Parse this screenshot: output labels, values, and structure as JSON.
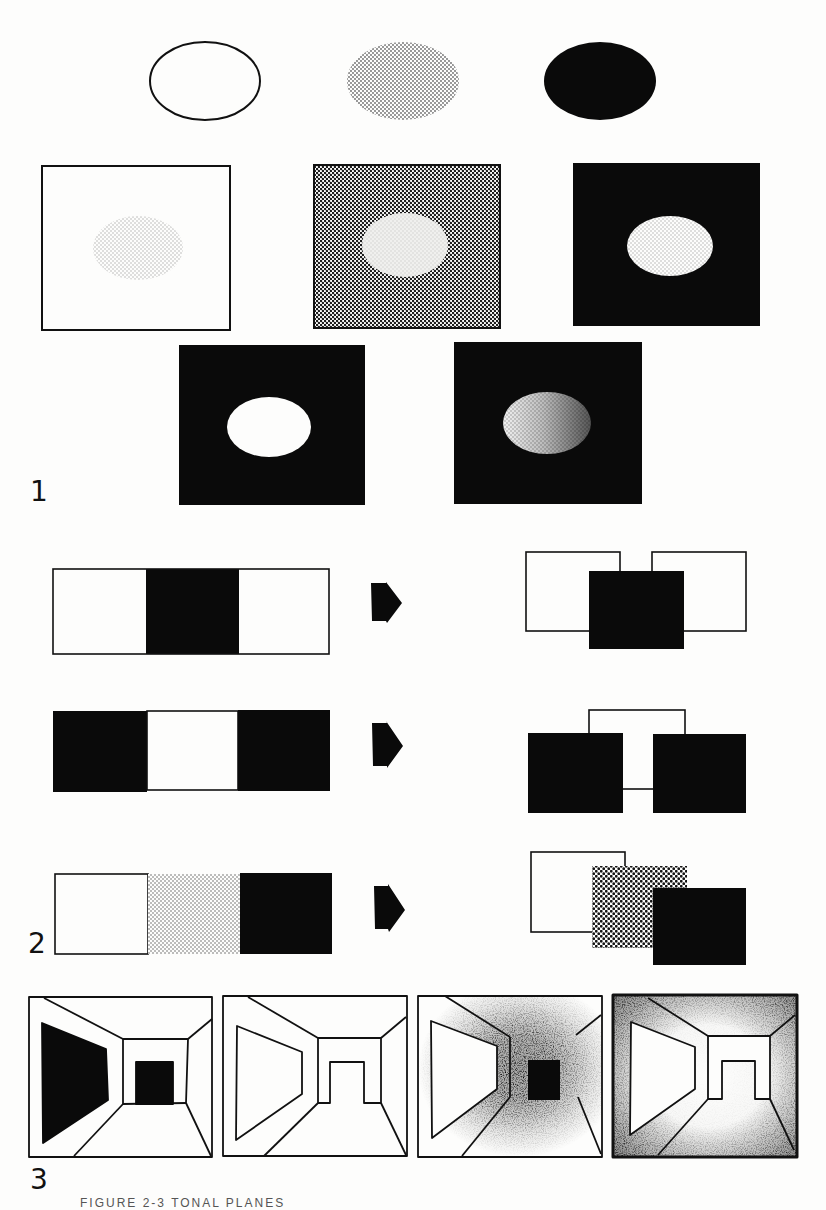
{
  "figure": {
    "section_labels": [
      "1",
      "2",
      "3"
    ],
    "caption": "FIGURE 2-3   TONAL PLANES",
    "colors": {
      "ink": "#0a0a0a",
      "paper": "#fdfdfc",
      "stipple": "#9a9a9a"
    }
  },
  "section1": {
    "title": "Tone of a shape relative to its field",
    "ellipses": [
      {
        "name": "outline-ellipse",
        "fill": "white-outline"
      },
      {
        "name": "stippled-ellipse",
        "fill": "light-grey-stipple"
      },
      {
        "name": "black-ellipse",
        "fill": "black"
      }
    ],
    "panels": [
      {
        "name": "white-field-grey-ellipse",
        "field": "white",
        "shape": "light-grey stipple ellipse"
      },
      {
        "name": "grey-field-light-ellipse",
        "field": "mid-grey stipple",
        "shape": "very light ellipse"
      },
      {
        "name": "black-field-grey-ellipse",
        "field": "black",
        "shape": "light-grey stipple ellipse"
      },
      {
        "name": "black-field-white-ellipse",
        "field": "black",
        "shape": "white ellipse"
      },
      {
        "name": "black-field-gradient-ellipse",
        "field": "black",
        "shape": "gradient-shaded ellipse"
      }
    ]
  },
  "section2": {
    "title": "Tonal strips interpreted as overlapping planes",
    "rows": [
      {
        "strip": [
          "white",
          "black",
          "white"
        ],
        "arrow": "right-arrow",
        "result": "black plane in front of two white planes"
      },
      {
        "strip": [
          "black",
          "white",
          "black"
        ],
        "arrow": "right-arrow",
        "result": "two black planes in front of a white plane"
      },
      {
        "strip": [
          "white",
          "grey",
          "black"
        ],
        "arrow": "right-arrow",
        "result": "white, grey, black planes stepping forward"
      }
    ]
  },
  "section3": {
    "title": "Corridor rendered with different tonal schemes",
    "panels": [
      {
        "name": "corridor-black-accents",
        "style": "black left wall panel and black doorway"
      },
      {
        "name": "corridor-line-only",
        "style": "outline only"
      },
      {
        "name": "corridor-dark-center",
        "style": "stipple darkening toward center, black doorway"
      },
      {
        "name": "corridor-dark-edges",
        "style": "stipple darkening toward edges, light center"
      }
    ]
  }
}
